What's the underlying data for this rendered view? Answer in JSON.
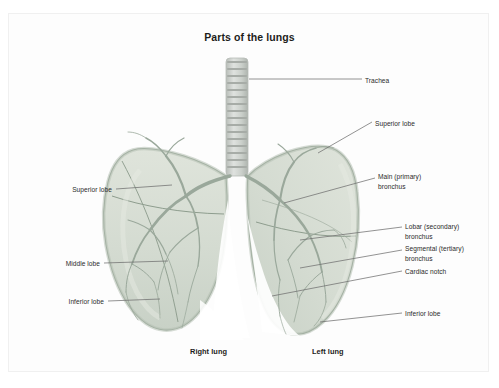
{
  "figure": {
    "title": "Parts of the lungs",
    "background_color": "#ffffff",
    "panel_color": "#fdfdfd",
    "lung_fill": "#d7ded4",
    "lung_outline": "#9aa89a",
    "trachea_color": "#c9cdc9",
    "bronchi_color": "#9fada0",
    "leader_color": "#6f6f6f",
    "text_color": "#2b2b2b"
  },
  "labels": {
    "trachea": "Trachea",
    "superior_lobe_right_side": "Superior lobe",
    "main_bronchus": "Main (primary)\nbronchus",
    "lobar_bronchus": "Lobar (secondary)\nbronchus",
    "segmental_bronchus": "Segmental (tertiary)\nbronchus",
    "cardiac_notch": "Cardiac notch",
    "inferior_lobe_right_side": "Inferior lobe",
    "superior_lobe_left_side": "Superior lobe",
    "middle_lobe": "Middle lobe",
    "inferior_lobe_left_side": "Inferior lobe",
    "right_lung": "Right lung",
    "left_lung": "Left lung"
  }
}
